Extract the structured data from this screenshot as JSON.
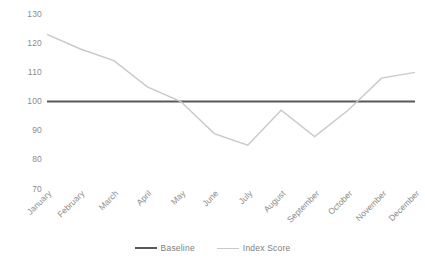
{
  "chart_data": {
    "type": "line",
    "title": "",
    "subtitle": "",
    "xlabel": "",
    "ylabel": "",
    "categories": [
      "January",
      "February",
      "March",
      "April",
      "May",
      "June",
      "July",
      "August",
      "September",
      "October",
      "November",
      "December"
    ],
    "series": [
      {
        "name": "Baseline",
        "color": "#59595b",
        "width": 2.2,
        "values": [
          100,
          100,
          100,
          100,
          100,
          100,
          100,
          100,
          100,
          100,
          100,
          100
        ]
      },
      {
        "name": "Index Score",
        "color": "#c9c9cb",
        "width": 1.4,
        "values": [
          123,
          118,
          114,
          105,
          100,
          89,
          85,
          97,
          88,
          97,
          108,
          110
        ]
      }
    ],
    "ylim": [
      70,
      130
    ],
    "yticks": [
      130,
      120,
      110,
      100,
      90,
      80,
      70
    ],
    "ytick_labels": [
      "130",
      "120",
      "110",
      "100",
      "90",
      "80",
      "70"
    ],
    "grid": false,
    "legend_position": "bottom",
    "legend_entries": [
      "Baseline",
      "Index Score"
    ],
    "axis_label_color": "#8c8c8c",
    "background": "#ffffff"
  }
}
